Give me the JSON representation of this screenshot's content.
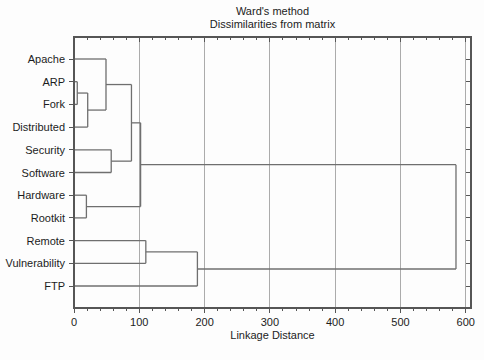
{
  "chart_data": {
    "type": "dendrogram",
    "orientation": "left-to-right",
    "title": "Ward's method",
    "subtitle": "Dissimilarities from matrix",
    "xlabel": "Linkage Distance",
    "leaves": [
      "Apache",
      "ARP",
      "Fork",
      "Distributed",
      "Security",
      "Software",
      "Hardware",
      "Rootkit",
      "Remote",
      "Vulnerability",
      "FTP"
    ],
    "merges": [
      {
        "a": "ARP",
        "b": "Fork",
        "distance": 5
      },
      {
        "a": "m0",
        "b": "Distributed",
        "distance": 21
      },
      {
        "a": "Apache",
        "b": "m1",
        "distance": 49
      },
      {
        "a": "Security",
        "b": "Software",
        "distance": 57
      },
      {
        "a": "m2",
        "b": "m3",
        "distance": 88
      },
      {
        "a": "Hardware",
        "b": "Rootkit",
        "distance": 19
      },
      {
        "a": "m4",
        "b": "m5",
        "distance": 102
      },
      {
        "a": "Remote",
        "b": "Vulnerability",
        "distance": 110
      },
      {
        "a": "m7",
        "b": "FTP",
        "distance": 189
      },
      {
        "a": "m6",
        "b": "m8",
        "distance": 585
      }
    ],
    "x_ticks": [
      0,
      100,
      200,
      300,
      400,
      500,
      600
    ],
    "x_tick_labels": [
      "0",
      "100",
      "200",
      "300",
      "400",
      "500",
      "600"
    ],
    "x_minor_step": 20,
    "xlim": [
      0,
      608
    ],
    "grid": "vertical-major",
    "legend": "none",
    "colors": {
      "line": "#6f6f6f",
      "grid": "#ababab",
      "axis": "#565656",
      "text": "#1c1c1c",
      "background": "#fdfdfd"
    }
  }
}
